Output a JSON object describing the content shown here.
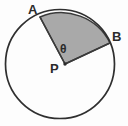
{
  "figure": {
    "type": "geometry-diagram",
    "background_color": "#fdfdfd",
    "labels": {
      "point_a": "A",
      "point_b": "B",
      "center_p": "P",
      "angle_theta": "θ"
    },
    "geometry": {
      "circle": {
        "center_x": 60,
        "center_y": 64,
        "radius": 54.5,
        "stroke_color": "#2f2f2f",
        "stroke_width": 1.6,
        "fill_color": "none"
      },
      "sector": {
        "vertex_x": 65,
        "vertex_y": 64,
        "point_a_x": 40,
        "point_a_y": 17,
        "point_b_x": 110,
        "point_b_y": 43,
        "fill_color": "#a9a9a9",
        "stroke_color": "#3a3a3a",
        "stroke_width": 1.5,
        "start_angle_deg": 26,
        "end_angle_deg": 118,
        "central_angle_deg": 92
      },
      "vertex_dot": {
        "x": 65,
        "y": 64,
        "radius": 1.6,
        "color": "#2b2b2b"
      }
    },
    "label_positions": {
      "point_a": {
        "x": 28,
        "y": 3
      },
      "point_b": {
        "x": 112,
        "y": 30
      },
      "center_p": {
        "x": 50,
        "y": 62
      },
      "angle_theta": {
        "x": 60,
        "y": 43
      }
    }
  }
}
